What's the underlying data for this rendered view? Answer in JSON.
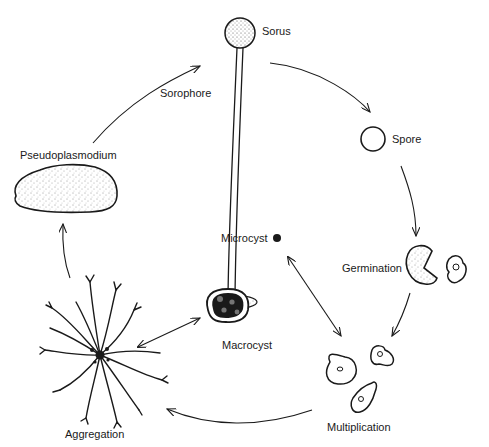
{
  "diagram": {
    "stages": {
      "sorus": {
        "label": "Sorus"
      },
      "sorophore": {
        "label": "Sorophore"
      },
      "spore": {
        "label": "Spore"
      },
      "germination": {
        "label": "Germination"
      },
      "multiplication": {
        "label": "Multiplication"
      },
      "aggregation": {
        "label": "Aggregation"
      },
      "pseudoplasmodium": {
        "label": "Pseudoplasmodium"
      },
      "microcyst": {
        "label": "Microcyst"
      },
      "macrocyst": {
        "label": "Macrocyst"
      }
    },
    "colors": {
      "ink": "#1a1a1a",
      "background": "#ffffff"
    },
    "flow": [
      "Spore -> Germination",
      "Germination -> Multiplication",
      "Multiplication -> Aggregation",
      "Aggregation -> Pseudoplasmodium",
      "Pseudoplasmodium -> Sorus (Sorophore)",
      "Sorus -> Spore",
      "Multiplication <-> Microcyst",
      "Aggregation <-> Macrocyst"
    ]
  }
}
